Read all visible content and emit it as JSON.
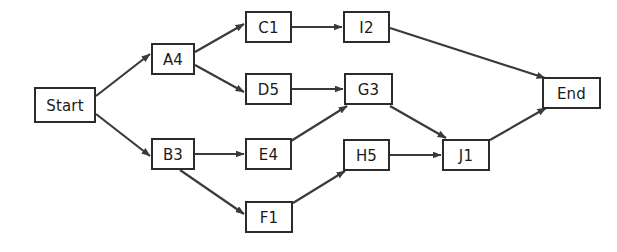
{
  "diagram": {
    "type": "flowchart",
    "title": "",
    "background_color": "#ffffff",
    "node_fill_color": "#ffffff",
    "node_border_color": "#2b2b2b",
    "edge_color": "#3a3a3a",
    "text_color": "#1a1a1a",
    "nodes": [
      {
        "id": "start",
        "label": "Start",
        "x": 35,
        "y": 88,
        "w": 60,
        "h": 34
      },
      {
        "id": "a4",
        "label": "A4",
        "x": 152,
        "y": 44,
        "w": 42,
        "h": 30
      },
      {
        "id": "b3",
        "label": "B3",
        "x": 152,
        "y": 139,
        "w": 42,
        "h": 30
      },
      {
        "id": "c1",
        "label": "C1",
        "x": 246,
        "y": 12,
        "w": 45,
        "h": 30
      },
      {
        "id": "d5",
        "label": "D5",
        "x": 246,
        "y": 74,
        "w": 45,
        "h": 30
      },
      {
        "id": "e4",
        "label": "E4",
        "x": 246,
        "y": 139,
        "w": 45,
        "h": 30
      },
      {
        "id": "f1",
        "label": "F1",
        "x": 246,
        "y": 202,
        "w": 46,
        "h": 30
      },
      {
        "id": "g3",
        "label": "G3",
        "x": 345,
        "y": 74,
        "w": 47,
        "h": 30
      },
      {
        "id": "h5",
        "label": "H5",
        "x": 344,
        "y": 140,
        "w": 45,
        "h": 30
      },
      {
        "id": "i2",
        "label": "I2",
        "x": 344,
        "y": 12,
        "w": 45,
        "h": 30
      },
      {
        "id": "j1",
        "label": "J1",
        "x": 443,
        "y": 140,
        "w": 46,
        "h": 30
      },
      {
        "id": "end",
        "label": "End",
        "x": 543,
        "y": 78,
        "w": 57,
        "h": 30
      }
    ],
    "edges": [
      {
        "id": "start-a4",
        "from": "Start",
        "to": "A4",
        "x1": 96,
        "y1": 96,
        "x2": 150,
        "y2": 54
      },
      {
        "id": "start-b3",
        "from": "Start",
        "to": "B3",
        "x1": 96,
        "y1": 114,
        "x2": 150,
        "y2": 156
      },
      {
        "id": "a4-c1",
        "from": "A4",
        "to": "C1",
        "x1": 195,
        "y1": 52,
        "x2": 244,
        "y2": 24
      },
      {
        "id": "a4-d5",
        "from": "A4",
        "to": "D5",
        "x1": 195,
        "y1": 65,
        "x2": 244,
        "y2": 92
      },
      {
        "id": "c1-i2",
        "from": "C1",
        "to": "I2",
        "x1": 292,
        "y1": 27,
        "x2": 342,
        "y2": 27
      },
      {
        "id": "d5-g3",
        "from": "D5",
        "to": "G3",
        "x1": 292,
        "y1": 89,
        "x2": 343,
        "y2": 89
      },
      {
        "id": "b3-e4",
        "from": "B3",
        "to": "E4",
        "x1": 195,
        "y1": 154,
        "x2": 244,
        "y2": 154
      },
      {
        "id": "b3-f1",
        "from": "B3",
        "to": "F1",
        "x1": 180,
        "y1": 170,
        "x2": 244,
        "y2": 214
      },
      {
        "id": "e4-g3",
        "from": "E4",
        "to": "G3",
        "x1": 291,
        "y1": 141,
        "x2": 347,
        "y2": 106
      },
      {
        "id": "f1-h5",
        "from": "F1",
        "to": "H5",
        "x1": 293,
        "y1": 203,
        "x2": 345,
        "y2": 171
      },
      {
        "id": "g3-j1",
        "from": "G3",
        "to": "J1",
        "x1": 390,
        "y1": 106,
        "x2": 446,
        "y2": 138
      },
      {
        "id": "h5-j1",
        "from": "H5",
        "to": "J1",
        "x1": 390,
        "y1": 155,
        "x2": 441,
        "y2": 155
      },
      {
        "id": "i2-end",
        "from": "I2",
        "to": "End",
        "x1": 390,
        "y1": 28,
        "x2": 545,
        "y2": 78
      },
      {
        "id": "j1-end",
        "from": "J1",
        "to": "End",
        "x1": 490,
        "y1": 140,
        "x2": 546,
        "y2": 108
      }
    ]
  }
}
